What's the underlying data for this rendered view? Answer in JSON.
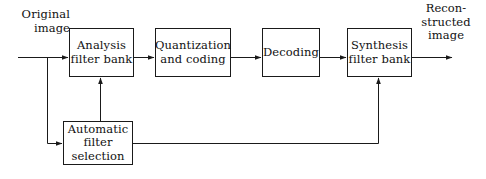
{
  "diagram": {
    "stroke_color": "#1a1a1a",
    "text_color": "#111111",
    "background_color": "#ffffff",
    "nodes": [
      {
        "id": "analysis-filter-bank",
        "label": "Analysis\nfilter bank",
        "x": 69,
        "y": 28,
        "w": 65,
        "h": 49
      },
      {
        "id": "quantization-and-coding",
        "label": "Quantization\nand coding",
        "x": 155,
        "y": 28,
        "w": 76,
        "h": 49
      },
      {
        "id": "decoding",
        "label": "Decoding",
        "x": 262,
        "y": 28,
        "w": 58,
        "h": 49
      },
      {
        "id": "synthesis-filter-bank",
        "label": "Synthesis\nfilter bank",
        "x": 347,
        "y": 28,
        "w": 65,
        "h": 49
      },
      {
        "id": "automatic-filter-selection",
        "label": "Automatic\nfilter\nselection",
        "x": 63,
        "y": 121,
        "w": 70,
        "h": 44
      }
    ],
    "io_labels": [
      {
        "id": "input-label",
        "text": "Original\nimage",
        "x": 8,
        "y": 8,
        "w": 62,
        "align": "right-align"
      },
      {
        "id": "output-label",
        "text": "Recon-\nstructed\nimage",
        "x": 410,
        "y": 2,
        "w": 72,
        "align": "center-align"
      }
    ],
    "edges": [
      {
        "id": "input-to-analysis",
        "from": "input",
        "to": "analysis-filter-bank",
        "arrow": true
      },
      {
        "id": "analysis-to-quantization",
        "from": "analysis-filter-bank",
        "to": "quantization-and-coding",
        "arrow": true
      },
      {
        "id": "quantization-to-decoding",
        "from": "quantization-and-coding",
        "to": "decoding",
        "arrow": true
      },
      {
        "id": "decoding-to-synthesis",
        "from": "decoding",
        "to": "synthesis-filter-bank",
        "arrow": true
      },
      {
        "id": "synthesis-to-output",
        "from": "synthesis-filter-bank",
        "to": "output",
        "arrow": true
      },
      {
        "id": "input-tap-to-automatic",
        "from": "input",
        "to": "automatic-filter-selection",
        "arrow": true
      },
      {
        "id": "automatic-to-analysis",
        "from": "automatic-filter-selection",
        "to": "analysis-filter-bank",
        "arrow": true
      },
      {
        "id": "automatic-to-synthesis",
        "from": "automatic-filter-selection",
        "to": "synthesis-filter-bank",
        "arrow": true
      }
    ]
  }
}
